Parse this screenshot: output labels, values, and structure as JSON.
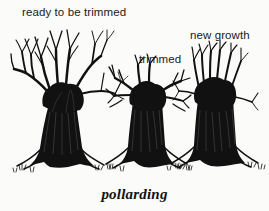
{
  "figure": {
    "caption": "pollarding",
    "background_color": "#fbfbfa",
    "ink_color": "#111111",
    "medium": "pen-and-ink line drawing"
  },
  "labels": {
    "ready": "ready to be trimmed",
    "trimmed": "trimmed",
    "new_growth": "new growth"
  },
  "diagram_data": {
    "type": "illustration",
    "subject": "pollarding",
    "stage_count": 3,
    "stages": [
      {
        "order": 1,
        "label": "ready to be trimmed",
        "description": "Mature pollard with long slender forked branches grown out from the knuckle, ready for cutting",
        "branch_length": "long",
        "branch_count": 14
      },
      {
        "order": 2,
        "label": "trimmed",
        "description": "Same tree just after pollarding, branches cut back to short stubs at the knuckle",
        "branch_length": "short stubs",
        "branch_count": 10
      },
      {
        "order": 3,
        "label": "new growth",
        "description": "Tree regrowing, straight vertical shoots sprouting from the pollard head",
        "branch_length": "medium vertical shoots",
        "branch_count": 12
      }
    ]
  }
}
